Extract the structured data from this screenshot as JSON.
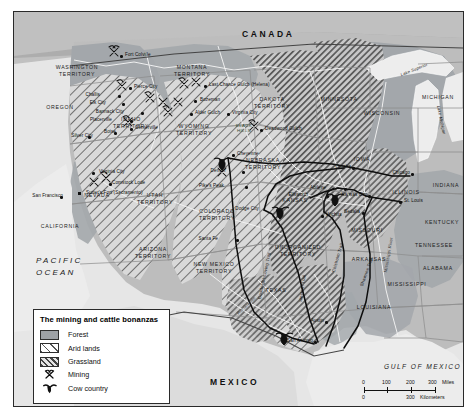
{
  "map": {
    "title_in_legend": "The mining and cattle bonanzas",
    "countries": [
      {
        "name": "CANADA",
        "x": 228,
        "y": 18
      },
      {
        "name": "MEXICO",
        "x": 196,
        "y": 366
      },
      {
        "name": "PACIFIC OCEAN",
        "x": 22,
        "y": 243
      },
      {
        "name": "GULF OF MEXICO",
        "x": 370,
        "y": 352
      }
    ],
    "lakes": [
      {
        "name": "Lake Superior",
        "x": 386,
        "y": 56
      },
      {
        "name": "Lake Michigan",
        "x": 412,
        "y": 106
      }
    ],
    "states": [
      {
        "name": "WASHINGTON TERRITORY",
        "x": 63,
        "y": 52,
        "w": 58
      },
      {
        "name": "OREGON",
        "x": 46,
        "y": 93,
        "w": 46
      },
      {
        "name": "MONTANA TERRITORY",
        "x": 178,
        "y": 52,
        "w": 95
      },
      {
        "name": "IDAHO TERRITORY",
        "x": 117,
        "y": 104,
        "w": 46
      },
      {
        "name": "WYOMING TERRITORY",
        "x": 180,
        "y": 111,
        "w": 46
      },
      {
        "name": "DAKOTA TERRITORY",
        "x": 258,
        "y": 84,
        "w": 48
      },
      {
        "name": "NEBRASKA TERRITORY",
        "x": 249,
        "y": 145,
        "w": 52
      },
      {
        "name": "MINNESOTA",
        "x": 325,
        "y": 85,
        "w": 48
      },
      {
        "name": "WISCONSIN",
        "x": 368,
        "y": 99,
        "w": 46
      },
      {
        "name": "MICHIGAN",
        "x": 424,
        "y": 83,
        "w": 40
      },
      {
        "name": "IOWA",
        "x": 348,
        "y": 145,
        "w": 32
      },
      {
        "name": "NEVADA",
        "x": 83,
        "y": 181,
        "w": 36
      },
      {
        "name": "CALIFORNIA",
        "x": 46,
        "y": 212,
        "w": 46
      },
      {
        "name": "UTAH TERRITORY",
        "x": 141,
        "y": 180,
        "w": 42
      },
      {
        "name": "COLORADO TERRITORY",
        "x": 203,
        "y": 196,
        "w": 46
      },
      {
        "name": "ARIZONA TERRITORY",
        "x": 139,
        "y": 234,
        "w": 46
      },
      {
        "name": "NEW MEXICO TERRITORY",
        "x": 200,
        "y": 249,
        "w": 48
      },
      {
        "name": "KANSAS",
        "x": 281,
        "y": 186,
        "w": 36
      },
      {
        "name": "UNORGANIZED TERRITORY",
        "x": 284,
        "y": 232,
        "w": 52
      },
      {
        "name": "TEXAS",
        "x": 262,
        "y": 276,
        "w": 36
      },
      {
        "name": "MISSOURI",
        "x": 353,
        "y": 216,
        "w": 40
      },
      {
        "name": "ARKANSAS",
        "x": 355,
        "y": 245,
        "w": 42
      },
      {
        "name": "LOUISIANA",
        "x": 360,
        "y": 293,
        "w": 42
      },
      {
        "name": "MISSISSIPPI",
        "x": 393,
        "y": 270,
        "w": 42
      },
      {
        "name": "ILLINOIS",
        "x": 392,
        "y": 178,
        "w": 36
      },
      {
        "name": "INDIANA",
        "x": 432,
        "y": 171,
        "w": 34
      },
      {
        "name": "KENTUCKY",
        "x": 428,
        "y": 208,
        "w": 40
      },
      {
        "name": "TENNESSEE",
        "x": 420,
        "y": 231,
        "w": 42
      },
      {
        "name": "ALABAMA",
        "x": 424,
        "y": 254,
        "w": 40
      }
    ],
    "region_label": {
      "name": "BLACK HILLS",
      "x": 230,
      "y": 111
    },
    "cities": [
      {
        "name": "Fort Colville",
        "x": 108,
        "y": 44,
        "side": "right"
      },
      {
        "name": "Pierce City",
        "x": 117,
        "y": 76,
        "side": "right"
      },
      {
        "name": "Challis",
        "x": 89,
        "y": 84,
        "side": "left"
      },
      {
        "name": "Elk City",
        "x": 95,
        "y": 92,
        "side": "left"
      },
      {
        "name": "Bannack City",
        "x": 113,
        "y": 101,
        "side": "left"
      },
      {
        "name": "Placerville",
        "x": 101,
        "y": 109,
        "side": "left"
      },
      {
        "name": "Centerville",
        "x": 118,
        "y": 117,
        "side": "right"
      },
      {
        "name": "Boise",
        "x": 105,
        "y": 121,
        "side": "left"
      },
      {
        "name": "Silver City",
        "x": 82,
        "y": 125,
        "side": "left"
      },
      {
        "name": "Last Chance Gulch (Helena)",
        "x": 192,
        "y": 74,
        "side": "right"
      },
      {
        "name": "Bozeman",
        "x": 183,
        "y": 89,
        "side": "right"
      },
      {
        "name": "Alder Gulch",
        "x": 178,
        "y": 102,
        "side": "right"
      },
      {
        "name": "Virginia City",
        "x": 215,
        "y": 102,
        "side": "right"
      },
      {
        "name": "Deadwood Gulch",
        "x": 248,
        "y": 118,
        "side": "right"
      },
      {
        "name": "Cheyenne",
        "x": 220,
        "y": 143,
        "side": "right"
      },
      {
        "name": "Denver",
        "x": 215,
        "y": 160,
        "side": "left"
      },
      {
        "name": "Pike's Peak",
        "x": 213,
        "y": 175,
        "side": "left"
      },
      {
        "name": "Santa Fe",
        "x": 207,
        "y": 228,
        "side": "left"
      },
      {
        "name": "Dodge City",
        "x": 248,
        "y": 198,
        "side": "left"
      },
      {
        "name": "Ellsworth",
        "x": 297,
        "y": 184,
        "side": "left"
      },
      {
        "name": "Abilene",
        "x": 315,
        "y": 177,
        "side": "left"
      },
      {
        "name": "Wichita",
        "x": 309,
        "y": 204,
        "side": "right"
      },
      {
        "name": "Kansas City",
        "x": 356,
        "y": 184,
        "side": "left"
      },
      {
        "name": "Omaha",
        "x": 340,
        "y": 156,
        "side": "left"
      },
      {
        "name": "Sedalia",
        "x": 349,
        "y": 201,
        "side": "left"
      },
      {
        "name": "St. Louis",
        "x": 387,
        "y": 190,
        "side": "right"
      },
      {
        "name": "Chicago",
        "x": 399,
        "y": 162,
        "side": "left"
      },
      {
        "name": "San Francisco",
        "x": 52,
        "y": 185,
        "side": "left"
      },
      {
        "name": "Sutter's Fort (Sacramento)",
        "x": 69,
        "y": 182,
        "side": "right"
      },
      {
        "name": "Virginia City",
        "x": 82,
        "y": 161,
        "side": "right"
      },
      {
        "name": "Comstock Lode",
        "x": 95,
        "y": 172,
        "side": "right"
      },
      {
        "name": "Austin",
        "x": 313,
        "y": 310,
        "side": "left"
      },
      {
        "name": "San Antonio",
        "x": 302,
        "y": 330,
        "side": "left"
      }
    ],
    "trails": [
      {
        "name": "Goodnight-Loving Trail",
        "x": 246,
        "y": 285
      },
      {
        "name": "Western Trail",
        "x": 287,
        "y": 288
      },
      {
        "name": "Chisholm Trail",
        "x": 320,
        "y": 258
      },
      {
        "name": "Shawnee Trail",
        "x": 348,
        "y": 272
      },
      {
        "name": "Rio Grande",
        "x": 224,
        "y": 300
      },
      {
        "name": "Mississippi River",
        "x": 372,
        "y": 258
      }
    ],
    "legend": {
      "title": "The mining and cattle bonanzas",
      "items": [
        {
          "label": "Forest",
          "swatch": "forest"
        },
        {
          "label": "Arid lands",
          "swatch": "arid"
        },
        {
          "label": "Grassland",
          "swatch": "grass"
        },
        {
          "label": "Mining",
          "swatch": "mining-pick-icon"
        },
        {
          "label": "Cow country",
          "swatch": "cow-head-icon"
        }
      ]
    },
    "scale": {
      "miles_ticks": [
        "0",
        "100",
        "200",
        "300"
      ],
      "miles_unit": "Miles",
      "km_ticks": [
        "0",
        "300"
      ],
      "km_unit": "Kilometers"
    }
  }
}
